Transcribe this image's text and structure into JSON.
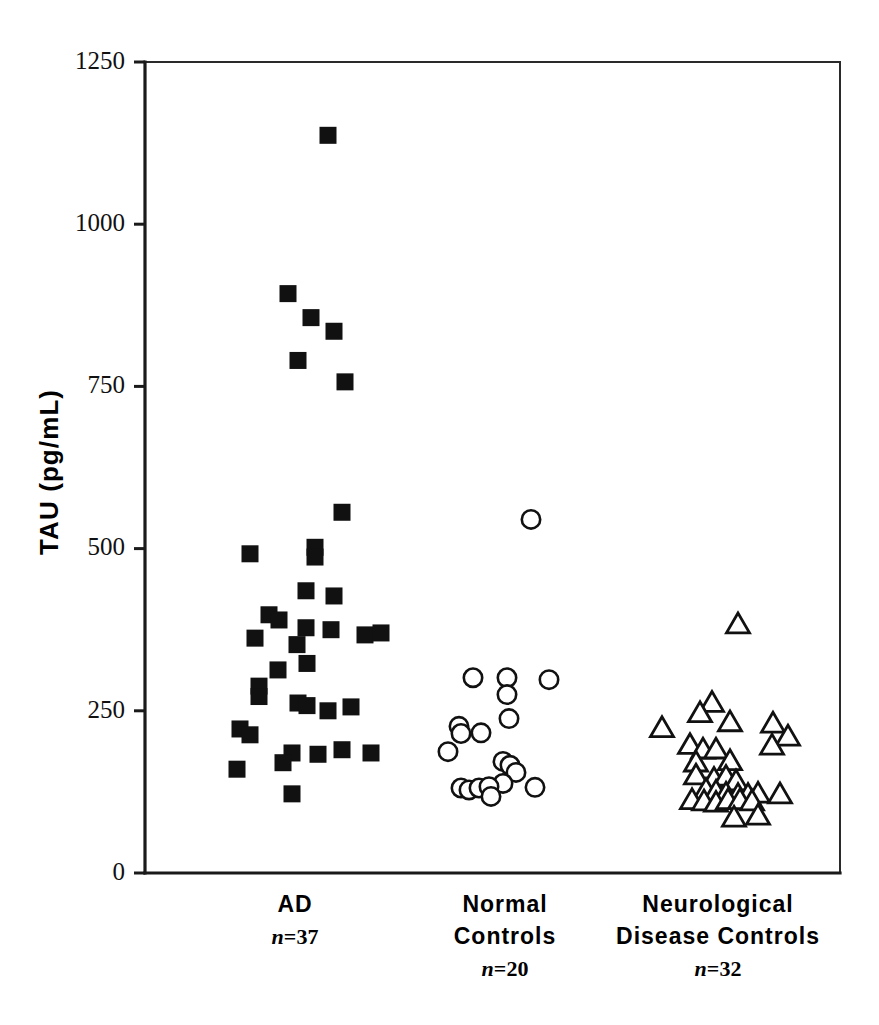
{
  "figure": {
    "background": "#ffffff",
    "ink_color": "#111111"
  },
  "chart_data": {
    "type": "scatter",
    "title": "",
    "subtitle": "",
    "xlabel": "",
    "ylabel": "TAU  (pg/mL)",
    "ylim": [
      0,
      1250
    ],
    "yticks": [
      0,
      250,
      500,
      750,
      1000,
      1250
    ],
    "ytick_labels": [
      "0",
      "250",
      "500",
      "750",
      "1000",
      "1250"
    ],
    "grid": false,
    "legend": "none",
    "axis_frame": "box-left-bottom",
    "categories": [
      "AD",
      "Normal Controls",
      "Neurological Disease Controls"
    ],
    "series": [
      {
        "name": "AD",
        "label_line1": "AD",
        "label_line2": "",
        "n_label": "n=37",
        "n": 37,
        "marker": "filled-square",
        "marker_color": "#111111",
        "x_center": 295,
        "points": [
          {
            "jx": 33,
            "y": 1137
          },
          {
            "jx": -7,
            "y": 893
          },
          {
            "jx": 16,
            "y": 856
          },
          {
            "jx": 39,
            "y": 835
          },
          {
            "jx": 3,
            "y": 790
          },
          {
            "jx": 50,
            "y": 757
          },
          {
            "jx": 47,
            "y": 556
          },
          {
            "jx": -45,
            "y": 492
          },
          {
            "jx": 20,
            "y": 502
          },
          {
            "jx": 20,
            "y": 487
          },
          {
            "jx": 11,
            "y": 435
          },
          {
            "jx": 39,
            "y": 427
          },
          {
            "jx": -26,
            "y": 398
          },
          {
            "jx": -16,
            "y": 390
          },
          {
            "jx": -40,
            "y": 362
          },
          {
            "jx": 11,
            "y": 378
          },
          {
            "jx": 36,
            "y": 375
          },
          {
            "jx": 70,
            "y": 367
          },
          {
            "jx": 86,
            "y": 370
          },
          {
            "jx": 2,
            "y": 352
          },
          {
            "jx": -17,
            "y": 313
          },
          {
            "jx": 12,
            "y": 323
          },
          {
            "jx": -36,
            "y": 288
          },
          {
            "jx": -36,
            "y": 272
          },
          {
            "jx": 3,
            "y": 262
          },
          {
            "jx": 12,
            "y": 258
          },
          {
            "jx": 56,
            "y": 256
          },
          {
            "jx": -55,
            "y": 222
          },
          {
            "jx": -45,
            "y": 213
          },
          {
            "jx": 33,
            "y": 250
          },
          {
            "jx": -3,
            "y": 185
          },
          {
            "jx": 23,
            "y": 183
          },
          {
            "jx": 47,
            "y": 190
          },
          {
            "jx": 76,
            "y": 185
          },
          {
            "jx": -58,
            "y": 160
          },
          {
            "jx": -12,
            "y": 170
          },
          {
            "jx": -3,
            "y": 122
          }
        ]
      },
      {
        "name": "Normal Controls",
        "label_line1": "Normal",
        "label_line2": "Controls",
        "n_label": "n=20",
        "n": 20,
        "marker": "open-circle",
        "marker_color": "#111111",
        "x_center": 505,
        "points": [
          {
            "jx": 26,
            "y": 545
          },
          {
            "jx": -32,
            "y": 301
          },
          {
            "jx": 2,
            "y": 301
          },
          {
            "jx": 44,
            "y": 298
          },
          {
            "jx": 2,
            "y": 275
          },
          {
            "jx": 4,
            "y": 238
          },
          {
            "jx": -46,
            "y": 226
          },
          {
            "jx": -44,
            "y": 215
          },
          {
            "jx": -24,
            "y": 216
          },
          {
            "jx": -57,
            "y": 187
          },
          {
            "jx": -2,
            "y": 172
          },
          {
            "jx": 5,
            "y": 166
          },
          {
            "jx": 11,
            "y": 155
          },
          {
            "jx": -2,
            "y": 138
          },
          {
            "jx": -44,
            "y": 131
          },
          {
            "jx": -36,
            "y": 128
          },
          {
            "jx": -26,
            "y": 131
          },
          {
            "jx": -16,
            "y": 133
          },
          {
            "jx": -14,
            "y": 118
          },
          {
            "jx": 30,
            "y": 132
          }
        ]
      },
      {
        "name": "Neurological Disease Controls",
        "label_line1": "Neurological",
        "label_line2": "Disease  Controls",
        "n_label": "n=32",
        "n": 32,
        "marker": "open-triangle",
        "marker_color": "#111111",
        "x_center": 718,
        "points": [
          {
            "jx": 20,
            "y": 383
          },
          {
            "jx": -6,
            "y": 262
          },
          {
            "jx": -18,
            "y": 246
          },
          {
            "jx": 12,
            "y": 232
          },
          {
            "jx": 55,
            "y": 230
          },
          {
            "jx": -56,
            "y": 223
          },
          {
            "jx": 70,
            "y": 210
          },
          {
            "jx": 54,
            "y": 196
          },
          {
            "jx": -28,
            "y": 197
          },
          {
            "jx": -15,
            "y": 190
          },
          {
            "jx": -2,
            "y": 190
          },
          {
            "jx": -22,
            "y": 170
          },
          {
            "jx": 12,
            "y": 172
          },
          {
            "jx": -22,
            "y": 150
          },
          {
            "jx": -4,
            "y": 145
          },
          {
            "jx": 8,
            "y": 148
          },
          {
            "jx": 18,
            "y": 141
          },
          {
            "jx": -12,
            "y": 128
          },
          {
            "jx": -2,
            "y": 125
          },
          {
            "jx": 8,
            "y": 122
          },
          {
            "jx": 20,
            "y": 120
          },
          {
            "jx": 30,
            "y": 120
          },
          {
            "jx": 40,
            "y": 122
          },
          {
            "jx": 62,
            "y": 121
          },
          {
            "jx": -26,
            "y": 112
          },
          {
            "jx": -14,
            "y": 110
          },
          {
            "jx": -2,
            "y": 108
          },
          {
            "jx": 10,
            "y": 112
          },
          {
            "jx": 22,
            "y": 112
          },
          {
            "jx": 34,
            "y": 110
          },
          {
            "jx": 40,
            "y": 88
          },
          {
            "jx": 16,
            "y": 85
          }
        ]
      }
    ]
  }
}
